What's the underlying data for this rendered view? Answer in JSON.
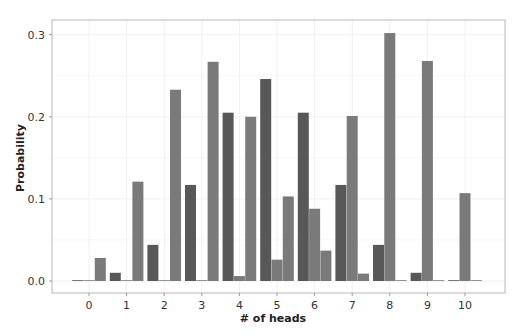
{
  "chart_data": {
    "type": "bar",
    "title": "",
    "xlabel": "# of heads",
    "ylabel": "Probability",
    "categories": [
      "0",
      "1",
      "2",
      "3",
      "4",
      "5",
      "6",
      "7",
      "8",
      "9",
      "10"
    ],
    "yticks": [
      "0.0",
      "0.1",
      "0.2",
      "0.3"
    ],
    "ylim": [
      -0.05,
      0.315
    ],
    "grid": true,
    "legend": null,
    "series": [
      {
        "name": "series-left",
        "color": "#585858",
        "offset": -1,
        "values": [
          0.001,
          0.01,
          0.044,
          0.117,
          0.205,
          0.246,
          0.205,
          0.117,
          0.044,
          0.01,
          0.001
        ]
      },
      {
        "name": "series-center",
        "color": "#7a7a7a",
        "offset": 0,
        "values": [
          0.0,
          0.0,
          0.0,
          0.001,
          0.006,
          0.026,
          0.088,
          0.201,
          0.302,
          0.268,
          0.107
        ]
      },
      {
        "name": "series-right",
        "color": "#7a7a7a",
        "offset": 1,
        "values": [
          0.028,
          0.121,
          0.233,
          0.267,
          0.2,
          0.103,
          0.037,
          0.009,
          0.001,
          0.0,
          0.0
        ]
      }
    ]
  },
  "colors": {
    "frame": "#b8b8b8",
    "grid": "#f0f0f0",
    "text": "#333333"
  }
}
